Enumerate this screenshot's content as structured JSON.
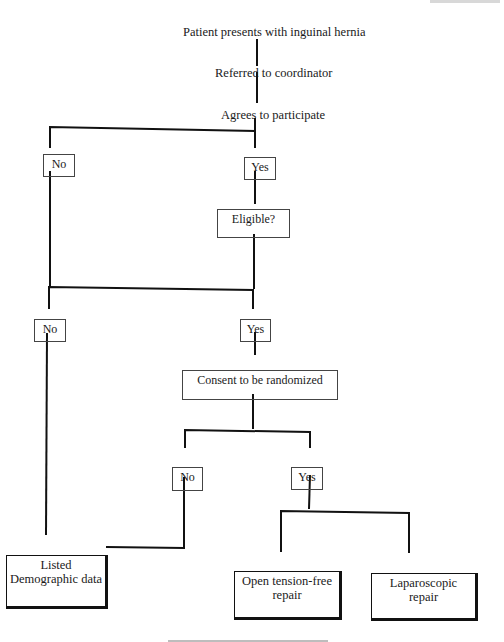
{
  "diagram": {
    "type": "flowchart",
    "title_nodes": [
      {
        "id": "start",
        "text": "Patient presents with inguinal hernia",
        "x": 183,
        "y": 26
      },
      {
        "id": "referred",
        "text": "Referred to coordinator",
        "x": 215,
        "y": 67
      },
      {
        "id": "agrees",
        "text": "Agrees to participate",
        "x": 221,
        "y": 109
      }
    ],
    "boxes": [
      {
        "id": "no1",
        "lines": [
          "No"
        ],
        "x": 43,
        "y": 154,
        "w": 32,
        "h": 23,
        "style": "small"
      },
      {
        "id": "yes1",
        "lines": [
          "Yes"
        ],
        "x": 244,
        "y": 157,
        "w": 32,
        "h": 23,
        "style": "small"
      },
      {
        "id": "eligible",
        "lines": [
          "Eligible?"
        ],
        "x": 217,
        "y": 209,
        "w": 73,
        "h": 29,
        "style": "small"
      },
      {
        "id": "no2",
        "lines": [
          "No"
        ],
        "x": 34,
        "y": 319,
        "w": 32,
        "h": 23,
        "style": "small"
      },
      {
        "id": "yes2",
        "lines": [
          "Yes"
        ],
        "x": 240,
        "y": 319,
        "w": 31,
        "h": 23,
        "style": "small"
      },
      {
        "id": "consent",
        "lines": [
          "Consent to be randomized"
        ],
        "x": 182,
        "y": 370,
        "w": 156,
        "h": 30,
        "style": "small"
      },
      {
        "id": "no3",
        "lines": [
          "No"
        ],
        "x": 172,
        "y": 467,
        "w": 31,
        "h": 24,
        "style": "small"
      },
      {
        "id": "yes3",
        "lines": [
          "Yes"
        ],
        "x": 291,
        "y": 467,
        "w": 32,
        "h": 23,
        "style": "small"
      },
      {
        "id": "listed",
        "lines": [
          "Listed",
          "Demographic data"
        ],
        "x": 6,
        "y": 555,
        "w": 102,
        "h": 54,
        "style": "terminal"
      },
      {
        "id": "open",
        "lines": [
          "Open tension-free",
          "repair"
        ],
        "x": 234,
        "y": 571,
        "w": 108,
        "h": 49,
        "style": "terminal"
      },
      {
        "id": "lap",
        "lines": [
          "Laparoscopic",
          "repair"
        ],
        "x": 371,
        "y": 573,
        "w": 107,
        "h": 48,
        "style": "terminal"
      }
    ],
    "connectors": [
      {
        "from": "start",
        "to": "referred",
        "points": [
          [
            257,
            39
          ],
          [
            257,
            66
          ]
        ]
      },
      {
        "from": "referred",
        "to": "agrees",
        "points": [
          [
            257,
            72
          ],
          [
            257,
            103
          ]
        ]
      },
      {
        "from": "agrees",
        "to": "split1",
        "points": [
          [
            255,
            118
          ],
          [
            255,
            130
          ]
        ]
      },
      {
        "from": "split1",
        "to": "no1/yes1",
        "points": [
          [
            50,
            148
          ],
          [
            50,
            127
          ],
          [
            255,
            131
          ],
          [
            255,
            148
          ]
        ]
      },
      {
        "from": "yes1",
        "to": "eligible",
        "points": [
          [
            255,
            171
          ],
          [
            255,
            204
          ]
        ]
      },
      {
        "from": "no1",
        "to": "merge2",
        "points": [
          [
            50,
            171
          ],
          [
            50,
            287
          ]
        ]
      },
      {
        "from": "eligible",
        "to": "merge2",
        "points": [
          [
            254,
            234
          ],
          [
            254,
            289
          ]
        ]
      },
      {
        "from": "merge2",
        "to": "no2/yes2",
        "points": [
          [
            49,
            309
          ],
          [
            49,
            287
          ],
          [
            253,
            290
          ],
          [
            253,
            309
          ]
        ]
      },
      {
        "from": "yes2",
        "to": "consent",
        "points": [
          [
            255,
            332
          ],
          [
            255,
            355
          ]
        ]
      },
      {
        "from": "no2",
        "to": "listed",
        "points": [
          [
            47,
            333
          ],
          [
            46,
            535
          ]
        ]
      },
      {
        "from": "consent",
        "to": "split3",
        "points": [
          [
            253,
            394
          ],
          [
            253,
            429
          ]
        ]
      },
      {
        "from": "split3",
        "to": "no3/yes3",
        "points": [
          [
            185,
            448
          ],
          [
            185,
            430
          ],
          [
            310,
            432
          ],
          [
            310,
            448
          ]
        ]
      },
      {
        "from": "no3",
        "to": "listed",
        "points": [
          [
            184,
            477
          ],
          [
            184,
            548
          ],
          [
            106,
            547
          ]
        ]
      },
      {
        "from": "yes3",
        "to": "split4",
        "points": [
          [
            310,
            475
          ],
          [
            309,
            509
          ]
        ]
      },
      {
        "from": "split4",
        "to": "open/lap",
        "points": [
          [
            281,
            552
          ],
          [
            281,
            511
          ],
          [
            409,
            513
          ],
          [
            409,
            553
          ]
        ]
      }
    ],
    "line_color": "#111111",
    "box_border_color": "#444444",
    "background": "#ffffff"
  },
  "faint_marks": {
    "running_header": "illegible",
    "caption": "illegible"
  }
}
